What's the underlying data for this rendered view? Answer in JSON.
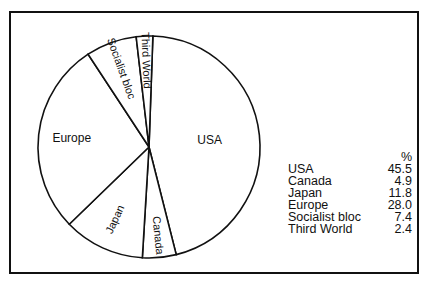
{
  "chart_data": {
    "type": "pie",
    "title": "",
    "unit": "%",
    "categories": [
      "USA",
      "Canada",
      "Japan",
      "Europe",
      "Socialist bloc",
      "Third World"
    ],
    "values": [
      45.5,
      4.9,
      11.8,
      28.0,
      7.4,
      2.4
    ],
    "legend_position": "right",
    "slice_labels": [
      "USA",
      "Canada",
      "Japan",
      "Europe",
      "Socialist bloc",
      "Third World"
    ]
  },
  "legend": {
    "header": "%",
    "rows": [
      {
        "label": "USA",
        "value": "45.5"
      },
      {
        "label": "Canada",
        "value": "4.9"
      },
      {
        "label": "Japan",
        "value": "11.8"
      },
      {
        "label": "Europe",
        "value": "28.0"
      },
      {
        "label": "Socialist bloc",
        "value": "7.4"
      },
      {
        "label": "Third World",
        "value": "2.4"
      }
    ]
  },
  "colors": {
    "stroke": "#111111",
    "fill": "#ffffff"
  }
}
